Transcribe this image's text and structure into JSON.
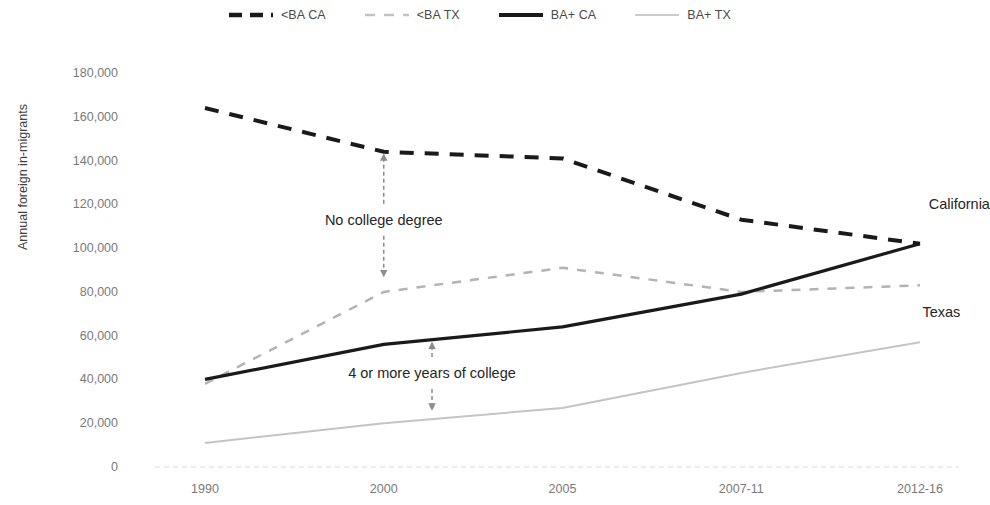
{
  "chart_data": {
    "type": "line",
    "title": "",
    "subtitle": "",
    "xlabel": "",
    "ylabel": "Annual foreign in-migrants",
    "categories": [
      "1990",
      "2000",
      "2005",
      "2007-11",
      "2012-16"
    ],
    "ylim": [
      0,
      180000
    ],
    "ytick_labels": [
      "0",
      "20,000",
      "40,000",
      "60,000",
      "80,000",
      "100,000",
      "120,000",
      "140,000",
      "160,000",
      "180,000"
    ],
    "ytick_values": [
      0,
      20000,
      40000,
      60000,
      80000,
      100000,
      120000,
      140000,
      160000,
      180000
    ],
    "grid": false,
    "legend_position": "top-center",
    "series": [
      {
        "name": "<BA CA",
        "values": [
          164000,
          144000,
          141000,
          113000,
          102000
        ],
        "color": "#1a1a1a",
        "style": "dashed",
        "width": 4
      },
      {
        "name": "<BA TX",
        "values": [
          38000,
          80000,
          91000,
          80000,
          83000
        ],
        "color": "#b3b3b3",
        "style": "dashed",
        "width": 2.5
      },
      {
        "name": "BA+ CA",
        "values": [
          40000,
          56000,
          64000,
          79000,
          102000
        ],
        "color": "#1a1a1a",
        "style": "solid",
        "width": 3.2
      },
      {
        "name": "BA+ TX",
        "values": [
          11000,
          20000,
          27000,
          43000,
          57000
        ],
        "color": "#c4c4c4",
        "style": "solid",
        "width": 2
      }
    ],
    "annotations": [
      {
        "text": "No college degree",
        "x_category_fraction": 1.0,
        "value": 113000,
        "arrow_from": 144000,
        "arrow_to": 86000,
        "kind": "double-arrow-vertical"
      },
      {
        "text": "4 or more years of college",
        "x_category_fraction": 1.27,
        "value": 43000,
        "arrow_from": 58000,
        "arrow_to": 25000,
        "kind": "double-arrow-vertical"
      }
    ],
    "series_labels": [
      {
        "text": "California",
        "value": 120000,
        "x_category_fraction": 4.22
      },
      {
        "text": "Texas",
        "value": 71000,
        "x_category_fraction": 4.12
      }
    ],
    "axis_color": "#d9d9d9",
    "tick_text_color": "#7a7a7a",
    "annotation_color": "#262626",
    "arrow_color": "#8c8c8c"
  },
  "legend": {
    "items": [
      {
        "label": "<BA CA",
        "icon": "dashed-thick-line-icon"
      },
      {
        "label": "<BA TX",
        "icon": "dashed-light-line-icon"
      },
      {
        "label": "BA+ CA",
        "icon": "solid-thick-line-icon"
      },
      {
        "label": "BA+ TX",
        "icon": "solid-light-line-icon"
      }
    ]
  }
}
